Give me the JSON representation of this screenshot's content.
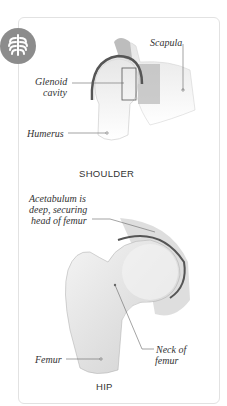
{
  "badge": {
    "icon": "ribcage-icon",
    "color": "#8c8c8c"
  },
  "shoulder": {
    "caption": "SHOULDER",
    "labels": {
      "scapula": "Scapula",
      "glenoid_1": "Glenoid",
      "glenoid_2": "cavity",
      "humerus": "Humerus"
    }
  },
  "hip": {
    "caption": "HIP",
    "labels": {
      "acetabulum_1": "Acetabulum is",
      "acetabulum_2": "deep, securing",
      "acetabulum_3": "head of femur",
      "femur": "Femur",
      "neck_1": "Neck of",
      "neck_2": "femur"
    }
  }
}
